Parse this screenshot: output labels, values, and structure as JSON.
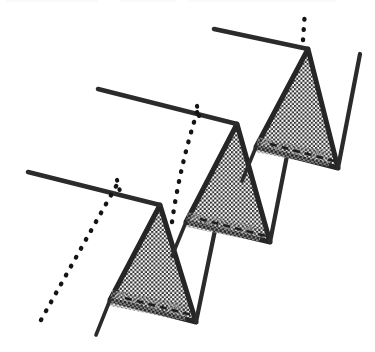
{
  "figure": {
    "caption": "",
    "background_color": "#ffffff",
    "ink_color": "#2b2b2b",
    "hatch_color": "#333333",
    "dotted_color": "#1c1c1c",
    "canvas": {
      "width": 375,
      "height": 352
    }
  },
  "chart_data": {
    "type": "line",
    "title": "",
    "xlabel": "",
    "ylabel": "",
    "xlim": [
      0,
      375
    ],
    "ylim": [
      352,
      0
    ],
    "grid": false,
    "legend": null,
    "series": [
      {
        "name": "baseline-1",
        "style": "solid",
        "points": [
          [
            28,
            172
          ],
          [
            160,
            205
          ]
        ]
      },
      {
        "name": "triangle-1",
        "style": "solid-filled-crosshatch",
        "points": [
          [
            160,
            205
          ],
          [
            196,
            322
          ],
          [
            110,
            300
          ],
          [
            160,
            205
          ]
        ]
      },
      {
        "name": "tail-1",
        "style": "solid",
        "points": [
          [
            110,
            300
          ],
          [
            96,
            335
          ]
        ]
      },
      {
        "name": "riser-1",
        "style": "solid",
        "points": [
          [
            196,
            322
          ],
          [
            237,
            124
          ]
        ]
      },
      {
        "name": "dotted-1",
        "style": "dotted",
        "points": [
          [
            41,
            318
          ],
          [
            97,
            205
          ],
          [
            118,
            180
          ]
        ]
      },
      {
        "name": "baseline-2",
        "style": "solid",
        "points": [
          [
            98,
            89
          ],
          [
            237,
            124
          ]
        ]
      },
      {
        "name": "triangle-2",
        "style": "solid-filled-crosshatch",
        "points": [
          [
            237,
            124
          ],
          [
            270,
            242
          ],
          [
            186,
            222
          ],
          [
            237,
            124
          ]
        ]
      },
      {
        "name": "tail-2",
        "style": "solid",
        "points": [
          [
            186,
            222
          ],
          [
            172,
            256
          ]
        ]
      },
      {
        "name": "riser-2",
        "style": "solid",
        "points": [
          [
            270,
            242
          ],
          [
            308,
            49
          ]
        ]
      },
      {
        "name": "dotted-2",
        "style": "dotted",
        "points": [
          [
            171,
            221
          ],
          [
            186,
            151
          ],
          [
            198,
            107
          ]
        ]
      },
      {
        "name": "baseline-3",
        "style": "solid",
        "points": [
          [
            214,
            29
          ],
          [
            308,
            49
          ]
        ]
      },
      {
        "name": "triangle-3",
        "style": "solid-filled-crosshatch",
        "points": [
          [
            308,
            49
          ],
          [
            338,
            168
          ],
          [
            256,
            147
          ],
          [
            308,
            49
          ]
        ]
      },
      {
        "name": "tail-3",
        "style": "solid",
        "points": [
          [
            256,
            147
          ],
          [
            242,
            181
          ]
        ]
      },
      {
        "name": "riser-3",
        "style": "solid",
        "points": [
          [
            338,
            168
          ],
          [
            360,
            54
          ]
        ]
      },
      {
        "name": "dotted-3",
        "style": "dotted",
        "points": [
          [
            302,
            38
          ],
          [
            304,
            12
          ]
        ]
      }
    ],
    "markers": [
      {
        "name": "tick-1",
        "points": [
          [
            117,
            180
          ],
          [
            121,
            195
          ]
        ]
      },
      {
        "name": "tick-2",
        "points": [
          [
            197,
            106
          ],
          [
            200,
            120
          ]
        ]
      },
      {
        "name": "tick-3",
        "points": [
          [
            303,
            34
          ],
          [
            305,
            46
          ]
        ]
      }
    ],
    "inner_dashes": [
      {
        "name": "inner-dash-1",
        "points": [
          [
            125,
            298
          ],
          [
            192,
            315
          ]
        ]
      },
      {
        "name": "inner-dash-2",
        "points": [
          [
            200,
            219
          ],
          [
            266,
            236
          ]
        ]
      },
      {
        "name": "inner-dash-3",
        "points": [
          [
            270,
            144
          ],
          [
            334,
            161
          ]
        ]
      }
    ]
  }
}
